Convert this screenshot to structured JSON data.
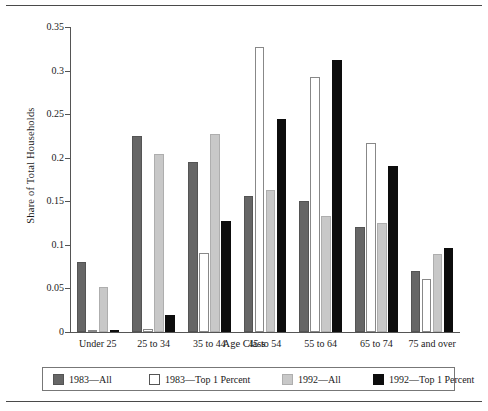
{
  "chart_data": {
    "type": "bar",
    "title": "",
    "xlabel": "Age Class",
    "ylabel": "Share of Total Households",
    "ylim": [
      0,
      0.35
    ],
    "yticks": [
      0,
      0.05,
      0.1,
      0.15,
      0.2,
      0.25,
      0.3,
      0.35
    ],
    "ytick_labels": [
      "0",
      "0.05",
      "0.1",
      "0.15",
      "0.2",
      "0.25",
      "0.3",
      "0.35"
    ],
    "grid": false,
    "legend_position": "bottom",
    "categories": [
      "Under 25",
      "25 to 34",
      "35 to 44",
      "45 to 54",
      "55 to 64",
      "65 to 74",
      "75 and over"
    ],
    "series": [
      {
        "name": "1983—All",
        "color": "#666666",
        "values": [
          0.08,
          0.225,
          0.195,
          0.156,
          0.15,
          0.12,
          0.07
        ]
      },
      {
        "name": "1983—Top 1 Percent",
        "color": "#ffffff",
        "values": [
          0.001,
          0.004,
          0.091,
          0.327,
          0.293,
          0.217,
          0.061
        ]
      },
      {
        "name": "1992—All",
        "color": "#c8c8c8",
        "values": [
          0.052,
          0.204,
          0.227,
          0.163,
          0.133,
          0.125,
          0.09
        ]
      },
      {
        "name": "1992—Top 1 Percent",
        "color": "#0d0d0d",
        "values": [
          0.002,
          0.019,
          0.127,
          0.245,
          0.312,
          0.191,
          0.096
        ]
      }
    ]
  },
  "legend": {
    "items": [
      {
        "label": "1983—All"
      },
      {
        "label": "1983—Top 1 Percent"
      },
      {
        "label": "1992—All"
      },
      {
        "label": "1992—Top 1 Percent"
      }
    ]
  }
}
